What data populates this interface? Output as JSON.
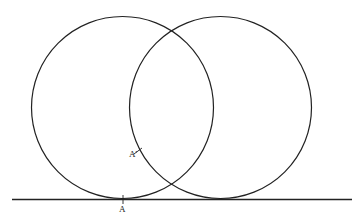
{
  "diagram": {
    "stroke_color": "#222222",
    "background": "#ffffff",
    "baseline": {
      "x1": 12,
      "y1": 199.5,
      "x2": 352,
      "y2": 199.5
    },
    "circles": [
      {
        "name": "left-circle",
        "cx": 122.5,
        "cy": 107.5,
        "r": 91
      },
      {
        "name": "right-circle",
        "cx": 220.5,
        "cy": 107.5,
        "r": 91
      }
    ],
    "points": [
      {
        "name": "A",
        "label": "A",
        "x": 123,
        "y": 199.5
      },
      {
        "name": "A-prime",
        "label": "A'",
        "x": 138,
        "y": 151
      }
    ],
    "labels": {
      "point_a": "A",
      "point_a_prime": "A'"
    }
  }
}
